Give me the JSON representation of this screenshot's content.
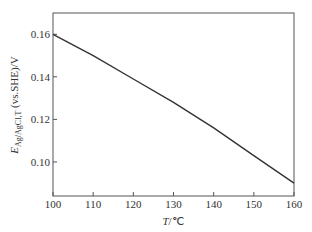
{
  "chart_data": {
    "type": "line",
    "title": "",
    "xlabel": "T/℃",
    "ylabel": "E_Ag/AgCl,T (vs.SHE)/V",
    "ylabel_parts": {
      "main": "E",
      "sub": "Ag/AgCl,T",
      "rest": " (vs.SHE)/V"
    },
    "xlabel_parts": {
      "italic": "T",
      "rest": "/℃"
    },
    "xlim": [
      100,
      160
    ],
    "ylim": [
      0.084,
      0.17
    ],
    "xticks": [
      100,
      110,
      120,
      130,
      140,
      150,
      160
    ],
    "xtick_labels": [
      "100",
      "110",
      "120",
      "130",
      "140",
      "150",
      "160"
    ],
    "yticks": [
      0.1,
      0.12,
      0.14,
      0.16
    ],
    "ytick_labels": [
      "0.10",
      "0.12",
      "0.14",
      "0.16"
    ],
    "grid": false,
    "legend": null,
    "series": [
      {
        "name": "E_Ag/AgCl,T",
        "color": "#333333",
        "x": [
          100,
          110,
          120,
          130,
          140,
          150,
          160
        ],
        "values": [
          0.16,
          0.15,
          0.139,
          0.128,
          0.116,
          0.103,
          0.09
        ]
      }
    ]
  }
}
